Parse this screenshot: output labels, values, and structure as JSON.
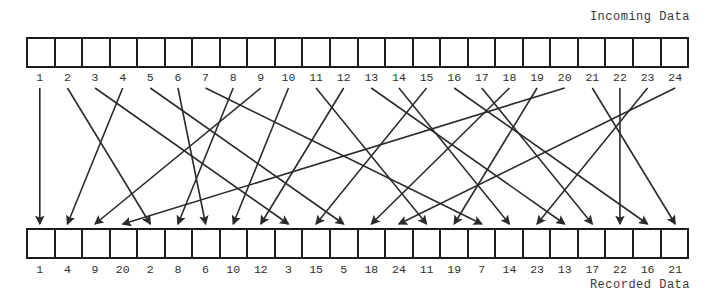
{
  "diagram": {
    "incoming_caption": "Incoming Data",
    "recorded_caption": "Recorded Data",
    "line_color": "#2b2b2b",
    "box_border_color": "#1c1c1c",
    "background_color": "#ffffff",
    "incoming_labels": [
      "1",
      "2",
      "3",
      "4",
      "5",
      "6",
      "7",
      "8",
      "9",
      "10",
      "11",
      "12",
      "13",
      "14",
      "15",
      "16",
      "17",
      "18",
      "19",
      "20",
      "21",
      "22",
      "23",
      "24"
    ],
    "recorded_labels": [
      "1",
      "4",
      "9",
      "20",
      "2",
      "8",
      "6",
      "10",
      "12",
      "3",
      "15",
      "5",
      "18",
      "24",
      "11",
      "19",
      "7",
      "14",
      "23",
      "13",
      "17",
      "22",
      "16",
      "21"
    ],
    "cell_count": 24,
    "mapping": [
      {
        "from": 1,
        "to_slot": 1
      },
      {
        "from": 2,
        "to_slot": 5
      },
      {
        "from": 3,
        "to_slot": 10
      },
      {
        "from": 4,
        "to_slot": 2
      },
      {
        "from": 5,
        "to_slot": 12
      },
      {
        "from": 6,
        "to_slot": 7
      },
      {
        "from": 7,
        "to_slot": 17
      },
      {
        "from": 8,
        "to_slot": 6
      },
      {
        "from": 9,
        "to_slot": 3
      },
      {
        "from": 10,
        "to_slot": 8
      },
      {
        "from": 11,
        "to_slot": 15
      },
      {
        "from": 12,
        "to_slot": 9
      },
      {
        "from": 13,
        "to_slot": 20
      },
      {
        "from": 14,
        "to_slot": 18
      },
      {
        "from": 15,
        "to_slot": 11
      },
      {
        "from": 16,
        "to_slot": 23
      },
      {
        "from": 17,
        "to_slot": 21
      },
      {
        "from": 18,
        "to_slot": 13
      },
      {
        "from": 19,
        "to_slot": 16
      },
      {
        "from": 20,
        "to_slot": 4
      },
      {
        "from": 21,
        "to_slot": 24
      },
      {
        "from": 22,
        "to_slot": 22
      },
      {
        "from": 23,
        "to_slot": 19
      },
      {
        "from": 24,
        "to_slot": 14
      }
    ]
  }
}
